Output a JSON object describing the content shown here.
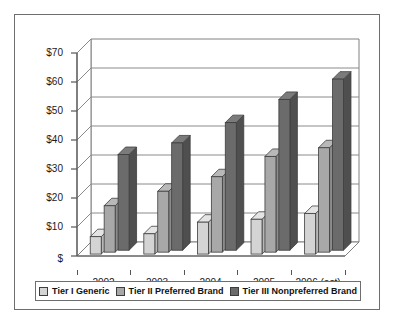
{
  "chart_data": {
    "type": "bar",
    "title": "",
    "subtitle": "",
    "xlabel": "",
    "ylabel": "",
    "categories": [
      "2002",
      "2003",
      "2004",
      "2005",
      "2006 (est)"
    ],
    "series": [
      {
        "name": "Tier I Generic",
        "values": [
          6,
          7,
          11,
          12,
          14
        ],
        "color": "#d4d4d4"
      },
      {
        "name": "Tier II Preferred Brand",
        "values": [
          16,
          21,
          26,
          33,
          36
        ],
        "color": "#a8a8a8"
      },
      {
        "name": "Tier III Nonpreferred Brand",
        "values": [
          33,
          37,
          44,
          52,
          59
        ],
        "color": "#6b6b6b"
      }
    ],
    "ylim": [
      0,
      70
    ],
    "yticks": [
      0,
      10,
      20,
      30,
      40,
      50,
      60,
      70
    ],
    "ytick_labels": [
      "$",
      "$10",
      "$20",
      "$30",
      "$40",
      "$50",
      "$60",
      "$70"
    ],
    "grid": true,
    "legend_position": "bottom",
    "three_d": true
  },
  "legend": {
    "items": [
      {
        "label": "Tier I Generic",
        "color": "#d4d4d4"
      },
      {
        "label": "Tier II Preferred Brand",
        "color": "#a8a8a8"
      },
      {
        "label": "Tier III Nonpreferred Brand",
        "color": "#6b6b6b"
      }
    ]
  },
  "axis": {
    "y_labels": [
      "$70",
      "$60",
      "$50",
      "$40",
      "$30",
      "$20",
      "$10",
      "$"
    ],
    "x_labels": [
      "2002",
      "2003",
      "2004",
      "2005",
      "2006 (est)"
    ]
  }
}
